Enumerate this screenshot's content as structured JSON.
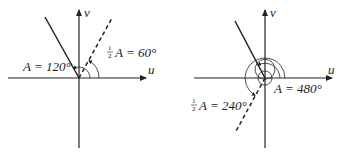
{
  "diagrams": [
    {
      "name": "left",
      "axis_labels": {
        "u": "u",
        "v": "v"
      },
      "angle_A_label": "A = 120°",
      "half_angle_label_prefix": "1",
      "half_angle_label_denom": "2",
      "half_angle_label": "A = 60°",
      "angle_A_deg": 120,
      "half_angle_deg": 60
    },
    {
      "name": "right",
      "axis_labels": {
        "u": "u",
        "v": "v"
      },
      "angle_A_label": "A = 480°",
      "half_angle_label_prefix": "1",
      "half_angle_label_denom": "2",
      "half_angle_label": "A = 240°",
      "angle_A_deg": 480,
      "half_angle_deg": 240
    }
  ],
  "colors": {
    "ink": "#222222",
    "background": "#ffffff"
  }
}
